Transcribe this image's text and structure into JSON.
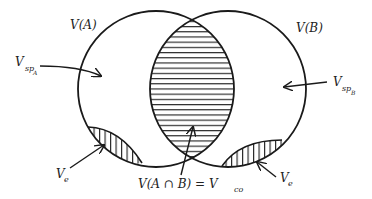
{
  "diagram": {
    "circles": [
      {
        "id": "A",
        "label": "V(A)"
      },
      {
        "id": "B",
        "label": "V(B)"
      }
    ],
    "labels": {
      "vsp_a_main": "V",
      "vsp_a_sub": "sp",
      "vsp_a_subsub": "A",
      "vsp_b_main": "V",
      "vsp_b_sub": "sp",
      "vsp_b_subsub": "B",
      "ve_left_main": "V",
      "ve_left_sub": "e",
      "ve_right_main": "V",
      "ve_right_sub": "e",
      "intersection_main": "V(A ∩ B) = V",
      "intersection_sub": "co"
    },
    "regions": [
      {
        "name": "intersection",
        "label": "V(A ∩ B) = Vco",
        "hatch": "horizontal"
      },
      {
        "name": "dead-end-left",
        "label": "Ve",
        "hatch": "vertical"
      },
      {
        "name": "dead-end-right",
        "label": "Ve",
        "hatch": "vertical"
      }
    ],
    "colors": {
      "stroke": "#1a1a1a",
      "background": "#ffffff"
    }
  }
}
